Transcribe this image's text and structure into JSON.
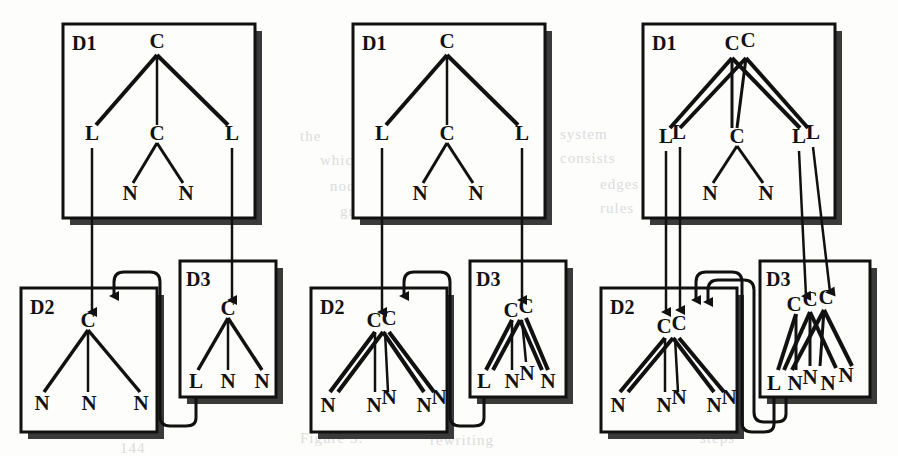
{
  "figure": {
    "panel_count": 3,
    "node_labels": {
      "C": "C",
      "L": "L",
      "N": "N"
    },
    "box_labels": {
      "d1": "D1",
      "d2": "D2",
      "d3": "D3"
    },
    "colors": {
      "ink": "#111111",
      "paper": "#fdfdfc",
      "shadow": "#3a3a3a",
      "ghost": "#dcdcdc"
    }
  },
  "panels": [
    {
      "id": "panel-1",
      "x": 0,
      "boxes": [
        {
          "name": "d1",
          "label": "D1",
          "x": 63,
          "y": 24,
          "w": 192,
          "h": 194
        },
        {
          "name": "d2",
          "label": "D2",
          "x": 21,
          "y": 288,
          "w": 136,
          "h": 144
        },
        {
          "name": "d3",
          "label": "D3",
          "x": 180,
          "y": 261,
          "w": 96,
          "h": 136
        }
      ],
      "d1_tree": {
        "roots": [
          "C"
        ],
        "level2": [
          "L",
          "C",
          "L"
        ],
        "level3": [
          "N",
          "N"
        ]
      },
      "d2_tree": {
        "roots": [
          "C"
        ],
        "leaves": [
          "N",
          "N",
          "N"
        ]
      },
      "d3_tree": {
        "roots": [
          "C"
        ],
        "leaves": [
          "L",
          "N",
          "N"
        ]
      },
      "arrows": {
        "to_d2": 1,
        "to_d3": 1,
        "feedback": 1
      }
    },
    {
      "id": "panel-2",
      "x": 290,
      "boxes": [
        {
          "name": "d1",
          "label": "D1",
          "x": 63,
          "y": 24,
          "w": 192,
          "h": 194
        },
        {
          "name": "d2",
          "label": "D2",
          "x": 21,
          "y": 288,
          "w": 136,
          "h": 144
        },
        {
          "name": "d3",
          "label": "D3",
          "x": 180,
          "y": 261,
          "w": 96,
          "h": 136
        }
      ],
      "d1_tree": {
        "roots": [
          "C"
        ],
        "level2": [
          "L",
          "C",
          "L"
        ],
        "level3": [
          "N",
          "N"
        ]
      },
      "d2_tree": {
        "roots": [
          "C",
          "C"
        ],
        "leaves": [
          "N",
          "N",
          "N",
          "N",
          "N"
        ]
      },
      "d3_tree": {
        "roots": [
          "C",
          "C"
        ],
        "leaves": [
          "L",
          "N",
          "N",
          "N"
        ]
      },
      "arrows": {
        "to_d2": 1,
        "to_d3": 1,
        "feedback": 1
      }
    },
    {
      "id": "panel-3",
      "x": 580,
      "boxes": [
        {
          "name": "d1",
          "label": "D1",
          "x": 63,
          "y": 24,
          "w": 192,
          "h": 194
        },
        {
          "name": "d2",
          "label": "D2",
          "x": 21,
          "y": 288,
          "w": 136,
          "h": 144
        },
        {
          "name": "d3",
          "label": "D3",
          "x": 180,
          "y": 261,
          "w": 110,
          "h": 136
        }
      ],
      "d1_tree": {
        "roots": [
          "C",
          "C"
        ],
        "level2": [
          "L",
          "L",
          "C",
          "L",
          "L"
        ],
        "level3": [
          "N",
          "N"
        ]
      },
      "d2_tree": {
        "roots": [
          "C",
          "C"
        ],
        "leaves": [
          "N",
          "N",
          "N",
          "N",
          "N"
        ]
      },
      "d3_tree": {
        "roots": [
          "C",
          "C",
          "C"
        ],
        "leaves": [
          "L",
          "N",
          "N",
          "N",
          "N"
        ]
      },
      "arrows": {
        "to_d2": 2,
        "to_d3": 2,
        "feedback": 2
      }
    }
  ],
  "ghost_text": [
    {
      "x": 120,
      "y": 130,
      "text": "mining"
    },
    {
      "x": 300,
      "y": 128,
      "text": "the"
    },
    {
      "x": 560,
      "y": 126,
      "text": "system"
    },
    {
      "x": 770,
      "y": 120,
      "text": "of"
    },
    {
      "x": 115,
      "y": 155,
      "text": "a graph is"
    },
    {
      "x": 320,
      "y": 152,
      "text": "which"
    },
    {
      "x": 560,
      "y": 150,
      "text": "consists"
    },
    {
      "x": 120,
      "y": 180,
      "text": "are the"
    },
    {
      "x": 330,
      "y": 178,
      "text": "nodes and"
    },
    {
      "x": 600,
      "y": 176,
      "text": "edges"
    },
    {
      "x": 120,
      "y": 205,
      "text": "labelled"
    },
    {
      "x": 340,
      "y": 203,
      "text": "graph"
    },
    {
      "x": 600,
      "y": 200,
      "text": "rules"
    },
    {
      "x": 300,
      "y": 430,
      "text": "Figure 3."
    },
    {
      "x": 430,
      "y": 432,
      "text": "rewriting"
    },
    {
      "x": 700,
      "y": 430,
      "text": "steps"
    },
    {
      "x": 120,
      "y": 440,
      "text": "144"
    }
  ]
}
